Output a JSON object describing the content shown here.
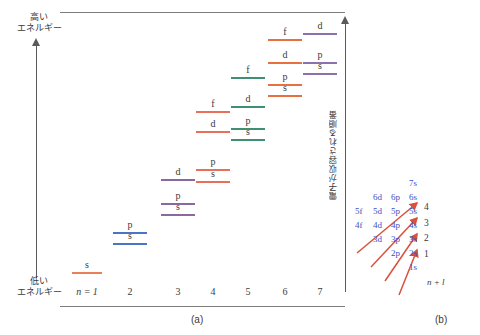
{
  "figure": {
    "caption_a": "(a)",
    "caption_b": "(b)"
  },
  "panel_a": {
    "axis_energy": {
      "high_label": "高い\nエネルギー",
      "high_label_line1": "高い",
      "high_label_line2": "エネルギー",
      "low_label_line1": "低い",
      "low_label_line2": "エネルギー"
    },
    "axis_order": {
      "label": "電子が収容される順番"
    },
    "x_axis": {
      "first_tick": "n = 1",
      "ticks": [
        "2",
        "3",
        "4",
        "5",
        "6",
        "7"
      ]
    },
    "shell_colors": {
      "n1": "#e8805a",
      "n2": "#4a74c4",
      "n3": "#8a6a9c",
      "n4": "#e8705a",
      "n5": "#3f8f72",
      "n6": "#e8703f",
      "n7": "#8a73ad"
    },
    "levels": [
      {
        "n": 1,
        "orbital": "s",
        "color": "#e8805a",
        "x": 72,
        "y": 272,
        "w": 30
      },
      {
        "n": 2,
        "orbital": "s",
        "color": "#4a74c4",
        "x": 113,
        "y": 243,
        "w": 34
      },
      {
        "n": 2,
        "orbital": "p",
        "color": "#4a74c4",
        "x": 113,
        "y": 232,
        "w": 34
      },
      {
        "n": 3,
        "orbital": "s",
        "color": "#8a6a9c",
        "x": 161,
        "y": 214,
        "w": 34
      },
      {
        "n": 3,
        "orbital": "p",
        "color": "#8a6a9c",
        "x": 161,
        "y": 203,
        "w": 34
      },
      {
        "n": 3,
        "orbital": "d",
        "color": "#8a6a9c",
        "x": 161,
        "y": 179,
        "w": 34
      },
      {
        "n": 4,
        "orbital": "s",
        "color": "#e8705a",
        "x": 196,
        "y": 181,
        "w": 34
      },
      {
        "n": 4,
        "orbital": "p",
        "color": "#e8705a",
        "x": 196,
        "y": 169,
        "w": 34
      },
      {
        "n": 4,
        "orbital": "d",
        "color": "#e8705a",
        "x": 196,
        "y": 131,
        "w": 34
      },
      {
        "n": 4,
        "orbital": "f",
        "color": "#e8705a",
        "x": 196,
        "y": 111,
        "w": 34
      },
      {
        "n": 5,
        "orbital": "s",
        "color": "#3f8f72",
        "x": 231,
        "y": 139,
        "w": 34
      },
      {
        "n": 5,
        "orbital": "p",
        "color": "#3f8f72",
        "x": 231,
        "y": 128,
        "w": 34
      },
      {
        "n": 5,
        "orbital": "d",
        "color": "#3f8f72",
        "x": 231,
        "y": 106,
        "w": 34
      },
      {
        "n": 5,
        "orbital": "f",
        "color": "#3f8f72",
        "x": 231,
        "y": 77,
        "w": 34
      },
      {
        "n": 6,
        "orbital": "s",
        "color": "#e8703f",
        "x": 268,
        "y": 95,
        "w": 34
      },
      {
        "n": 6,
        "orbital": "p",
        "color": "#e8703f",
        "x": 268,
        "y": 84,
        "w": 34
      },
      {
        "n": 6,
        "orbital": "d",
        "color": "#e8703f",
        "x": 268,
        "y": 62,
        "w": 34
      },
      {
        "n": 6,
        "orbital": "f",
        "color": "#e8703f",
        "x": 268,
        "y": 39,
        "w": 34
      },
      {
        "n": 7,
        "orbital": "s",
        "color": "#8a73ad",
        "x": 303,
        "y": 73,
        "w": 34
      },
      {
        "n": 7,
        "orbital": "p",
        "color": "#8a73ad",
        "x": 303,
        "y": 62,
        "w": 34
      },
      {
        "n": 7,
        "orbital": "d",
        "color": "#8a73ad",
        "x": 303,
        "y": 33,
        "w": 34
      }
    ]
  },
  "panel_b": {
    "orbitals": [
      {
        "label": "7s",
        "col": 3,
        "row": 0
      },
      {
        "label": "6d",
        "col": 1,
        "row": 1
      },
      {
        "label": "6p",
        "col": 2,
        "row": 1
      },
      {
        "label": "6s",
        "col": 3,
        "row": 1
      },
      {
        "label": "5f",
        "col": 0,
        "row": 2
      },
      {
        "label": "5d",
        "col": 1,
        "row": 2
      },
      {
        "label": "5p",
        "col": 2,
        "row": 2
      },
      {
        "label": "5s",
        "col": 3,
        "row": 2
      },
      {
        "label": "4f",
        "col": 0,
        "row": 3
      },
      {
        "label": "4d",
        "col": 1,
        "row": 3
      },
      {
        "label": "4p",
        "col": 2,
        "row": 3
      },
      {
        "label": "4s",
        "col": 3,
        "row": 3
      },
      {
        "label": "3d",
        "col": 1,
        "row": 4
      },
      {
        "label": "3p",
        "col": 2,
        "row": 4
      },
      {
        "label": "3s",
        "col": 3,
        "row": 4
      },
      {
        "label": "2p",
        "col": 2,
        "row": 5
      },
      {
        "label": "2s",
        "col": 3,
        "row": 5
      },
      {
        "label": "1s",
        "col": 3,
        "row": 6
      }
    ],
    "arrow_numbers": [
      "4",
      "3",
      "2",
      "1"
    ],
    "nl_label": "n + l",
    "arrow_color": "#d9503c",
    "orbital_color": "#3b4fc4"
  }
}
